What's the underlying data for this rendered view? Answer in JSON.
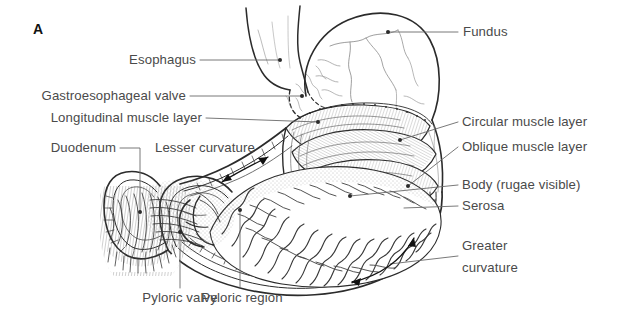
{
  "figure": {
    "panel_letter": "A",
    "background_color": "#ffffff",
    "line_color": "#2b2b2b",
    "label_color": "#4a4a4a"
  },
  "labels": {
    "esophagus": "Esophagus",
    "gastroesophageal_valve": "Gastroesophageal valve",
    "longitudinal_muscle_layer": "Longitudinal muscle layer",
    "duodenum": "Duodenum",
    "lesser_curvature": "Lesser curvature",
    "pyloric_valve": "Pyloric valve",
    "pyloric_region": "Pyloric region",
    "fundus": "Fundus",
    "circular_muscle_layer": "Circular muscle layer",
    "oblique_muscle_layer": "Oblique muscle layer",
    "body_rugae": "Body (rugae visible)",
    "serosa": "Serosa",
    "greater_curvature_line1": "Greater",
    "greater_curvature_line2": "curvature"
  }
}
